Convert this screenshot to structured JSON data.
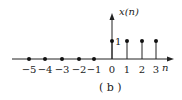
{
  "chart_data": {
    "type": "stem",
    "title": "",
    "caption": "( b )",
    "xlabel": "n",
    "ylabel": "x(n)",
    "x": [
      -5,
      -4,
      -3,
      -2,
      -1,
      0,
      1,
      2,
      3
    ],
    "values": [
      0,
      0,
      0,
      0,
      0,
      1,
      1,
      1,
      1
    ],
    "tick_labels": [
      "−5",
      "−4",
      "−3",
      "−2",
      "−1",
      "0",
      "1",
      "2",
      "3"
    ],
    "y_tick_labels": [
      "1"
    ],
    "ylim": [
      0,
      1
    ],
    "grid": false,
    "legend": null
  },
  "labels": {
    "ylabel": "x(n)",
    "xlabel": "n",
    "ytick": "1",
    "caption": "( b )"
  }
}
